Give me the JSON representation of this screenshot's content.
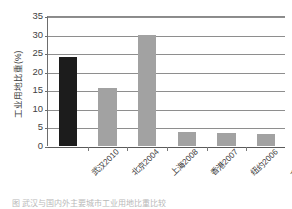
{
  "chart_data": {
    "type": "bar",
    "title": "",
    "subtitle": "",
    "xlabel": "",
    "ylabel": "工业用地比重(%)",
    "ylim": [
      0,
      35
    ],
    "y_ticks": [
      0,
      5,
      10,
      15,
      20,
      25,
      30,
      35
    ],
    "y_tick_labels": [
      "0",
      "5",
      "10",
      "15",
      "20",
      "25",
      "30",
      "35"
    ],
    "grid": true,
    "legend": false,
    "legend_position": "none",
    "categories": [
      "武汉2010",
      "北京2004",
      "上海2008",
      "香港2007",
      "纽约2006",
      "东京 2007"
    ],
    "values": [
      24,
      15.5,
      30,
      3.8,
      3.5,
      3.3
    ],
    "bar_colors": [
      "#1c1c1c",
      "#a2a2a2",
      "#a2a2a2",
      "#a2a2a2",
      "#a2a2a2",
      "#a2a2a2"
    ],
    "annotations": []
  },
  "figure": {
    "caption": "图       武汉与国内外主要城市工业用地比重比较"
  },
  "colors": {
    "highlight_bar": "#1c1c1c",
    "default_bar": "#a2a2a2",
    "gridline": "#8e8e8e",
    "axis": "#5a5a5a",
    "text": "#3b3b3b"
  }
}
